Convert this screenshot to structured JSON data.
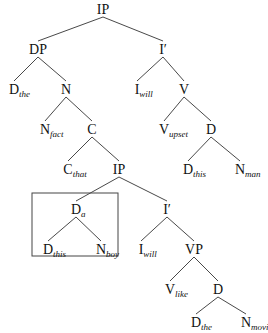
{
  "diagram": {
    "type": "syntax-tree",
    "colors": {
      "line": "#333333",
      "text": "#111111",
      "box": "#444444",
      "background": "#ffffff"
    },
    "nodes": [
      {
        "id": "ip_root",
        "label": "IP",
        "sub": "",
        "x": 103,
        "y": 14
      },
      {
        "id": "dp",
        "label": "DP",
        "sub": "",
        "x": 38,
        "y": 54
      },
      {
        "id": "ibar1",
        "label": "I′",
        "sub": "",
        "x": 163,
        "y": 54
      },
      {
        "id": "d_the1",
        "label": "D",
        "sub": "the",
        "x": 14,
        "y": 94
      },
      {
        "id": "n1",
        "label": "N",
        "sub": "",
        "x": 66,
        "y": 94
      },
      {
        "id": "i_will1",
        "label": "I",
        "sub": "will",
        "x": 137,
        "y": 94
      },
      {
        "id": "v1",
        "label": "V",
        "sub": "",
        "x": 184,
        "y": 94
      },
      {
        "id": "n_fact",
        "label": "N",
        "sub": "fact",
        "x": 45,
        "y": 134
      },
      {
        "id": "c1",
        "label": "C",
        "sub": "",
        "x": 92,
        "y": 134
      },
      {
        "id": "v_upset",
        "label": "V",
        "sub": "upset",
        "x": 164,
        "y": 134
      },
      {
        "id": "d1",
        "label": "D",
        "sub": "",
        "x": 211,
        "y": 134
      },
      {
        "id": "c_that",
        "label": "C",
        "sub": "that",
        "x": 68,
        "y": 174
      },
      {
        "id": "ip2",
        "label": "IP",
        "sub": "",
        "x": 119,
        "y": 174
      },
      {
        "id": "d_this1",
        "label": "D",
        "sub": "this",
        "x": 188,
        "y": 174
      },
      {
        "id": "n_man",
        "label": "N",
        "sub": "man",
        "x": 240,
        "y": 174
      },
      {
        "id": "d_a",
        "label": "D",
        "sub": "a",
        "x": 76,
        "y": 214
      },
      {
        "id": "ibar2",
        "label": "I′",
        "sub": "",
        "x": 167,
        "y": 214
      },
      {
        "id": "d_this2",
        "label": "D",
        "sub": "this",
        "x": 48,
        "y": 254
      },
      {
        "id": "n_boy",
        "label": "N",
        "sub": "boy",
        "x": 101,
        "y": 254
      },
      {
        "id": "i_will2",
        "label": "I",
        "sub": "will",
        "x": 141,
        "y": 254
      },
      {
        "id": "vp",
        "label": "VP",
        "sub": "",
        "x": 194,
        "y": 254
      },
      {
        "id": "v_like",
        "label": "V",
        "sub": "like",
        "x": 170,
        "y": 294
      },
      {
        "id": "d2",
        "label": "D",
        "sub": "",
        "x": 218,
        "y": 294
      },
      {
        "id": "d_the2",
        "label": "D",
        "sub": "the",
        "x": 196,
        "y": 327
      },
      {
        "id": "n_movie",
        "label": "N",
        "sub": "movie",
        "x": 246,
        "y": 327
      }
    ],
    "edges": [
      [
        "ip_root",
        "dp"
      ],
      [
        "ip_root",
        "ibar1"
      ],
      [
        "dp",
        "d_the1"
      ],
      [
        "dp",
        "n1"
      ],
      [
        "ibar1",
        "i_will1"
      ],
      [
        "ibar1",
        "v1"
      ],
      [
        "n1",
        "n_fact"
      ],
      [
        "n1",
        "c1"
      ],
      [
        "v1",
        "v_upset"
      ],
      [
        "v1",
        "d1"
      ],
      [
        "c1",
        "c_that"
      ],
      [
        "c1",
        "ip2"
      ],
      [
        "d1",
        "d_this1"
      ],
      [
        "d1",
        "n_man"
      ],
      [
        "ip2",
        "d_a"
      ],
      [
        "ip2",
        "ibar2"
      ],
      [
        "d_a",
        "d_this2"
      ],
      [
        "d_a",
        "n_boy"
      ],
      [
        "ibar2",
        "i_will2"
      ],
      [
        "ibar2",
        "vp"
      ],
      [
        "vp",
        "v_like"
      ],
      [
        "vp",
        "d2"
      ],
      [
        "d2",
        "d_the2"
      ],
      [
        "d2",
        "n_movie"
      ]
    ],
    "highlight_box": {
      "around": [
        "d_a",
        "d_this2",
        "n_boy"
      ],
      "x": 32,
      "y": 193,
      "width": 86,
      "height": 63
    }
  }
}
